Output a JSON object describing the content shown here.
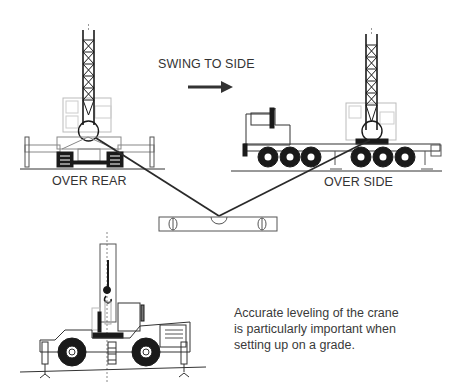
{
  "diagram": {
    "labels": {
      "swing": "SWING TO SIDE",
      "over_rear": "OVER REAR",
      "over_side": "OVER SIDE"
    },
    "caption": {
      "lines": [
        "Accurate leveling of the crane",
        "is particularly important when",
        "setting up on a grade."
      ]
    },
    "colors": {
      "line": "#1a1a1a",
      "faint": "#b8b8b8",
      "text": "#333333"
    }
  }
}
